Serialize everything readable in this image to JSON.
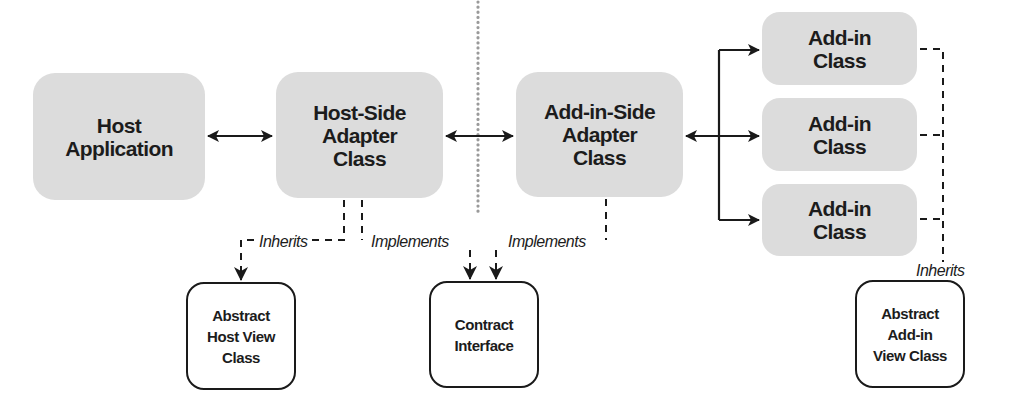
{
  "diagram": {
    "title": "",
    "colors": {
      "filled_box": "#dcdcdc",
      "stroke": "#1a1a1a",
      "divider": "#9a9a9a",
      "background": "#ffffff"
    },
    "nodes": {
      "host_application": {
        "label": "Host\nApplication"
      },
      "host_side_adapter": {
        "label": "Host-Side\nAdapter\nClass"
      },
      "addin_side_adapter": {
        "label": "Add-in-Side\nAdapter\nClass"
      },
      "addin_class_1": {
        "label": "Add-in\nClass"
      },
      "addin_class_2": {
        "label": "Add-in\nClass"
      },
      "addin_class_3": {
        "label": "Add-in\nClass"
      },
      "abstract_host_view": {
        "label": "Abstract\nHost View\nClass"
      },
      "contract_interface": {
        "label": "Contract\nInterface"
      },
      "abstract_addin_view": {
        "label": "Abstract\nAdd-in\nView Class"
      }
    },
    "edge_labels": {
      "host_inherits": "Inherits",
      "host_implements": "Implements",
      "addin_implements": "Implements",
      "addin_inherits": "Inherits"
    },
    "edges": [
      {
        "from": "host_application",
        "to": "host_side_adapter",
        "style": "solid",
        "direction": "both"
      },
      {
        "from": "host_side_adapter",
        "to": "addin_side_adapter",
        "style": "solid",
        "direction": "both",
        "crosses": "isolation-boundary"
      },
      {
        "from": "addin_side_adapter",
        "to": "addin_class_1",
        "style": "solid",
        "direction": "both"
      },
      {
        "from": "addin_side_adapter",
        "to": "addin_class_2",
        "style": "solid",
        "direction": "both"
      },
      {
        "from": "addin_side_adapter",
        "to": "addin_class_3",
        "style": "solid",
        "direction": "both"
      },
      {
        "from": "host_side_adapter",
        "to": "abstract_host_view",
        "style": "dashed",
        "label": "Inherits"
      },
      {
        "from": "host_side_adapter",
        "to": "contract_interface",
        "style": "dashed",
        "label": "Implements"
      },
      {
        "from": "addin_side_adapter",
        "to": "contract_interface",
        "style": "dashed",
        "label": "Implements"
      },
      {
        "from": "addin_class_1",
        "to": "abstract_addin_view",
        "style": "dashed",
        "label": "Inherits"
      },
      {
        "from": "addin_class_2",
        "to": "abstract_addin_view",
        "style": "dashed",
        "label": "Inherits"
      },
      {
        "from": "addin_class_3",
        "to": "abstract_addin_view",
        "style": "dashed",
        "label": "Inherits"
      }
    ],
    "divider": {
      "style": "dotted",
      "meaning": "isolation-boundary"
    }
  }
}
